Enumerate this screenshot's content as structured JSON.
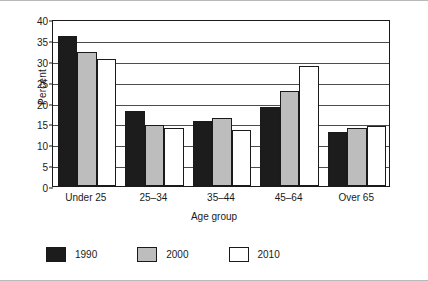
{
  "chart_data": {
    "type": "bar",
    "title": "",
    "xlabel": "Age group",
    "ylabel": "Percent",
    "categories": [
      "Under 25",
      "25–34",
      "35–44",
      "45–64",
      "Over 65"
    ],
    "series": [
      {
        "name": "1990",
        "color": "#1c1c1c",
        "values": [
          36.0,
          18.0,
          15.5,
          19.0,
          13.0
        ]
      },
      {
        "name": "2000",
        "color": "#bdbdbd",
        "values": [
          32.0,
          14.5,
          16.3,
          22.8,
          13.8
        ]
      },
      {
        "name": "2010",
        "color": "#ffffff",
        "values": [
          30.5,
          14.0,
          13.5,
          28.8,
          14.3
        ]
      }
    ],
    "ylim": [
      0,
      40
    ],
    "yticks": [
      0,
      5,
      10,
      15,
      20,
      25,
      30,
      35,
      40
    ],
    "ytick_labels": [
      "0",
      "5",
      "10",
      "15",
      "20",
      "25",
      "30",
      "35",
      "40"
    ],
    "grid": true,
    "legend_position": "bottom-left"
  }
}
